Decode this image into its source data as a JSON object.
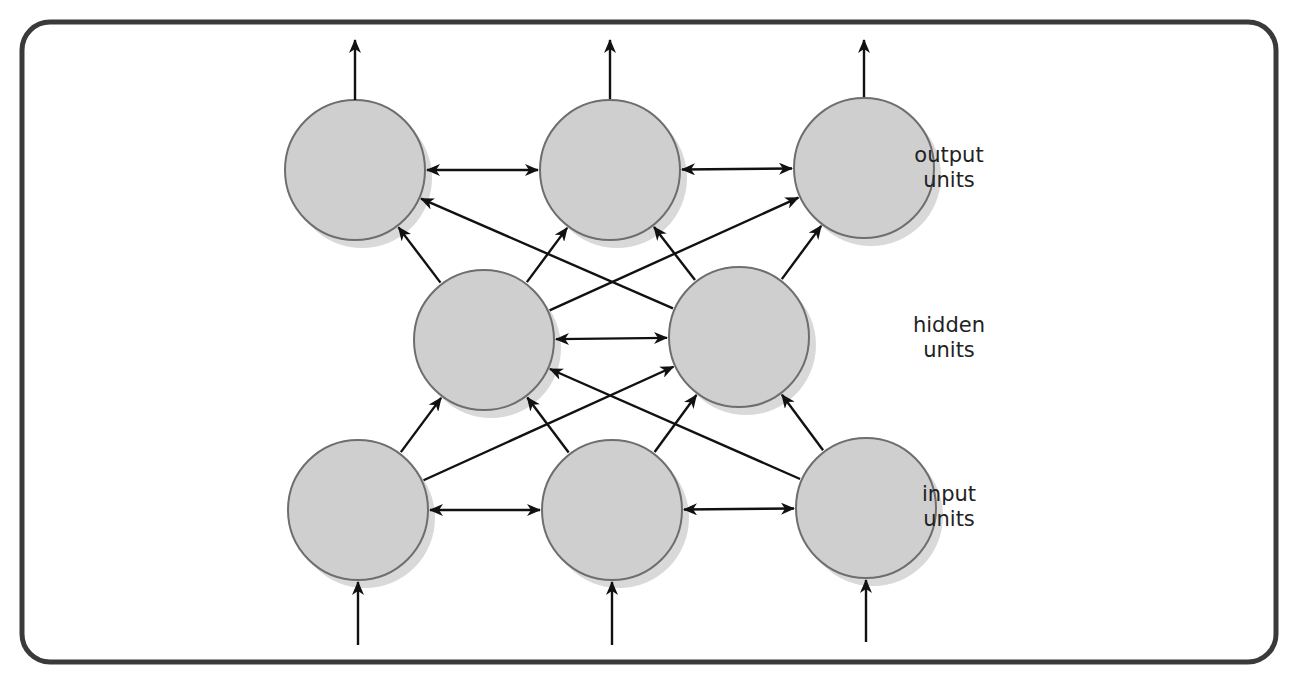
{
  "frame": {
    "x": 22,
    "y": 22,
    "width": 1254,
    "height": 640,
    "radius": 28,
    "stroke": "#3a3a3a",
    "stroke_width": 5
  },
  "style": {
    "node_fill": "#cfcfcf",
    "node_stroke": "#6e6e6e",
    "shadow": "#d9d9d9",
    "edge_color": "#111111",
    "node_radius": 70
  },
  "nodes": [
    {
      "id": "out1",
      "layer": "output",
      "cx": 355,
      "cy": 170
    },
    {
      "id": "out2",
      "layer": "output",
      "cx": 610,
      "cy": 170
    },
    {
      "id": "out3",
      "layer": "output",
      "cx": 864,
      "cy": 168
    },
    {
      "id": "hid1",
      "layer": "hidden",
      "cx": 484,
      "cy": 340
    },
    {
      "id": "hid2",
      "layer": "hidden",
      "cx": 739,
      "cy": 337
    },
    {
      "id": "in1",
      "layer": "input",
      "cx": 358,
      "cy": 510
    },
    {
      "id": "in2",
      "layer": "input",
      "cx": 612,
      "cy": 510
    },
    {
      "id": "in3",
      "layer": "input",
      "cx": 866,
      "cy": 508
    }
  ],
  "edges": [
    {
      "from": "in1",
      "to": "hid1",
      "bidirectional": false
    },
    {
      "from": "in1",
      "to": "hid2",
      "bidirectional": false
    },
    {
      "from": "in2",
      "to": "hid1",
      "bidirectional": false
    },
    {
      "from": "in2",
      "to": "hid2",
      "bidirectional": false
    },
    {
      "from": "in3",
      "to": "hid1",
      "bidirectional": false
    },
    {
      "from": "in3",
      "to": "hid2",
      "bidirectional": false
    },
    {
      "from": "hid1",
      "to": "out1",
      "bidirectional": false
    },
    {
      "from": "hid1",
      "to": "out2",
      "bidirectional": false
    },
    {
      "from": "hid1",
      "to": "out3",
      "bidirectional": false
    },
    {
      "from": "hid2",
      "to": "out1",
      "bidirectional": false
    },
    {
      "from": "hid2",
      "to": "out2",
      "bidirectional": false
    },
    {
      "from": "hid2",
      "to": "out3",
      "bidirectional": false
    },
    {
      "from": "out1",
      "to": "out2",
      "bidirectional": true
    },
    {
      "from": "out2",
      "to": "out3",
      "bidirectional": true
    },
    {
      "from": "hid1",
      "to": "hid2",
      "bidirectional": true
    },
    {
      "from": "in1",
      "to": "in2",
      "bidirectional": true
    },
    {
      "from": "in2",
      "to": "in3",
      "bidirectional": true
    }
  ],
  "external_arrows": [
    {
      "node": "out1",
      "direction": "up",
      "x1": 355,
      "y1": 100,
      "x2": 355,
      "y2": 40
    },
    {
      "node": "out2",
      "direction": "up",
      "x1": 610,
      "y1": 99,
      "x2": 610,
      "y2": 40
    },
    {
      "node": "out3",
      "direction": "up",
      "x1": 864,
      "y1": 97,
      "x2": 864,
      "y2": 40
    },
    {
      "node": "in1",
      "direction": "in",
      "x1": 358,
      "y1": 645,
      "x2": 358,
      "y2": 582
    },
    {
      "node": "in2",
      "direction": "in",
      "x1": 612,
      "y1": 645,
      "x2": 612,
      "y2": 582
    },
    {
      "node": "in3",
      "direction": "in",
      "x1": 866,
      "y1": 642,
      "x2": 866,
      "y2": 580
    }
  ],
  "labels": [
    {
      "id": "output-units",
      "line1": "output",
      "line2": "units",
      "x": 919,
      "y": 143
    },
    {
      "id": "hidden-units",
      "line1": "hidden",
      "line2": "units",
      "x": 919,
      "y": 313
    },
    {
      "id": "input-units",
      "line1": "input",
      "line2": "units",
      "x": 919,
      "y": 482
    }
  ]
}
